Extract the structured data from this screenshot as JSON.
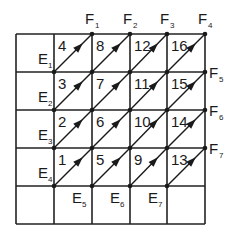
{
  "diagram": {
    "grid": {
      "x_lines": [
        16,
        54,
        92,
        130,
        167,
        205
      ],
      "y_lines": [
        34,
        72,
        110,
        148,
        186,
        224
      ],
      "stroke_color": "#222222"
    },
    "cells": [
      {
        "label": "4",
        "col": 1,
        "row": 0
      },
      {
        "label": "8",
        "col": 2,
        "row": 0
      },
      {
        "label": "12",
        "col": 3,
        "row": 0
      },
      {
        "label": "16",
        "col": 4,
        "row": 0
      },
      {
        "label": "3",
        "col": 1,
        "row": 1
      },
      {
        "label": "7",
        "col": 2,
        "row": 1
      },
      {
        "label": "11",
        "col": 3,
        "row": 1
      },
      {
        "label": "15",
        "col": 4,
        "row": 1
      },
      {
        "label": "2",
        "col": 1,
        "row": 2
      },
      {
        "label": "6",
        "col": 2,
        "row": 2
      },
      {
        "label": "10",
        "col": 3,
        "row": 2
      },
      {
        "label": "14",
        "col": 4,
        "row": 2
      },
      {
        "label": "1",
        "col": 1,
        "row": 3
      },
      {
        "label": "5",
        "col": 2,
        "row": 3
      },
      {
        "label": "9",
        "col": 3,
        "row": 3
      },
      {
        "label": "13",
        "col": 4,
        "row": 3
      }
    ],
    "f_labels": [
      {
        "main": "F",
        "sub": "1",
        "x": 85,
        "y": 24
      },
      {
        "main": "F",
        "sub": "2",
        "x": 123,
        "y": 24
      },
      {
        "main": "F",
        "sub": "3",
        "x": 160,
        "y": 24
      },
      {
        "main": "F",
        "sub": "4",
        "x": 198,
        "y": 24
      },
      {
        "main": "F",
        "sub": "5",
        "x": 209,
        "y": 78
      },
      {
        "main": "F",
        "sub": "6",
        "x": 209,
        "y": 116
      },
      {
        "main": "F",
        "sub": "7",
        "x": 209,
        "y": 154
      }
    ],
    "e_labels": [
      {
        "main": "E",
        "sub": "1",
        "x": 38,
        "y": 64
      },
      {
        "main": "E",
        "sub": "2",
        "x": 38,
        "y": 102
      },
      {
        "main": "E",
        "sub": "3",
        "x": 38,
        "y": 140
      },
      {
        "main": "E",
        "sub": "4",
        "x": 38,
        "y": 178
      },
      {
        "main": "E",
        "sub": "5",
        "x": 72,
        "y": 203
      },
      {
        "main": "E",
        "sub": "6",
        "x": 110,
        "y": 203
      },
      {
        "main": "E",
        "sub": "7",
        "x": 148,
        "y": 203
      }
    ]
  }
}
